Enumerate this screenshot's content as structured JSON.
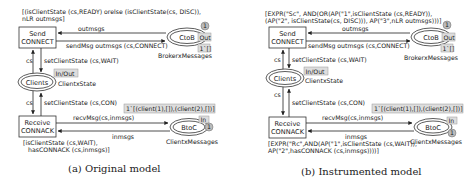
{
  "panels": [
    {
      "caption": "(a) Original model",
      "guard_top_1": "[(isClientState (cs,READY) orelse (isClientState(cs, DISC)),",
      "guard_top_2": "nLR outmsgs]",
      "transition_send": [
        "Send",
        "CONNECT"
      ],
      "transition_receive": [
        "Receive",
        "CONNACK"
      ],
      "place_ctob": "CtoB",
      "place_ctob_type": "BrokerxMessages",
      "place_ctob_port": "Out",
      "place_ctob_count": "1",
      "place_ctob_marking": "1`[]",
      "arc_outmsgs": "outmsgs",
      "arc_sendmsg": "sendMsg outmsgs (cs,CONNECT)",
      "arc_cs_top": "cs",
      "arc_setwait": "setClientState (cs,WAIT)",
      "place_clients": "Clients",
      "place_clients_type": "ClientxState",
      "place_clients_port": "In/Out",
      "arc_cs_bottom": "cs",
      "arc_setcon": "setClientState (cs,CON)",
      "place_btoc_marking": "1`[(client(1),[]),(client(2),[])]",
      "arc_recvmsg": "recvMsg(cs,inmsgs)",
      "arc_inmsgs": "inmsgs",
      "place_btoc": "BtoC",
      "place_btoc_type": "ClientxMessages",
      "place_btoc_port": "In",
      "place_btoc_count": "1",
      "guard_bottom_1": "[isClientState (cs,WAIT),",
      "guard_bottom_2": "hasCONNACK  (cs,inmsgs)]"
    },
    {
      "caption": "(b) Instrumented model",
      "guard_top_1": "[EXPR(\"Sc\", AND(OR(AP(\"1\",isClientState (cs,READY)),",
      "guard_top_2": "(AP(\"2\", isClientState(cs, DISC))), AP(\"3\",nLR outmsgs)))]",
      "transition_send": [
        "Send",
        "CONNECT"
      ],
      "transition_receive": [
        "Receive",
        "CONNACK"
      ],
      "place_ctob": "CtoB",
      "place_ctob_type": "BrokerxMessages",
      "place_ctob_port": "Out",
      "place_ctob_count": "1",
      "place_ctob_marking": "1`[]",
      "arc_outmsgs": "outmsgs",
      "arc_sendmsg": "sendMsg outmsgs (cs,CONNECT)",
      "arc_cs_top": "cs",
      "arc_setwait": "setClientState (cs,WAIT)",
      "place_clients": "Clients",
      "place_clients_type": "ClientxState",
      "place_clients_port": "In/Out",
      "arc_cs_bottom": "cs",
      "arc_setcon": "setClientState (cs,CON)",
      "place_btoc_marking": "1`[(client(1),[]),(client(2),[])]",
      "arc_recvmsg": "recvMsg(cs,inmsgs)",
      "arc_inmsgs": "inmsgs",
      "place_btoc": "BtoC",
      "place_btoc_type": "ClientxMessages",
      "place_btoc_port": "In",
      "place_btoc_count": "1",
      "guard_bottom_1": "[EXPR(\"Rc\",AND(AP(\"1\",isClientState (cs,WAIT)),",
      "guard_bottom_2": "AP(\"2\",hasCONNACK  (cs,inmsgs))))]"
    }
  ]
}
